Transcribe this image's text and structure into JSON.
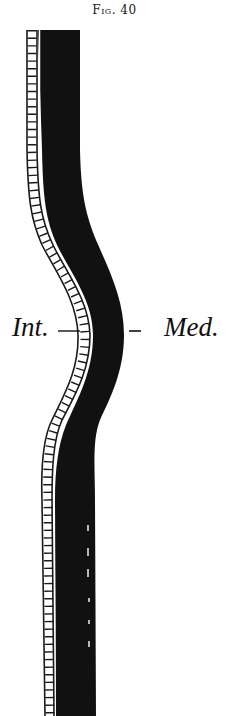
{
  "figure": {
    "caption": "Fig. 40",
    "labels": {
      "internal": "Int.",
      "medial": "Med."
    },
    "colors": {
      "band": "#111111",
      "ladder_stroke": "#1a1a1a",
      "background": "#ffffff"
    }
  }
}
